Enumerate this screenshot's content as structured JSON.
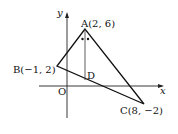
{
  "diagram": {
    "axes": {
      "x_label": "x",
      "y_label": "y",
      "origin_label": "O"
    },
    "points": {
      "A": {
        "label": "A(2, 6)"
      },
      "B": {
        "label": "B(−1, 2)"
      },
      "C": {
        "label": "C(8, −2)"
      },
      "D": {
        "label": "D"
      }
    }
  }
}
